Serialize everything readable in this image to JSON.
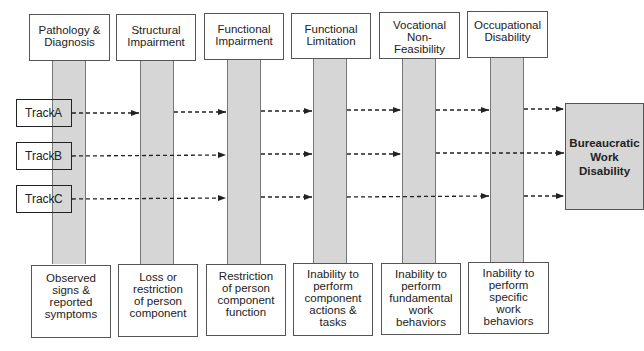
{
  "stages": [
    {
      "title": "Pathology & Diagnosis",
      "title_lines": [
        "Pathology &",
        "Diagnosis"
      ],
      "description_lines": [
        "Observed",
        "signs &",
        "reported",
        "symptoms"
      ]
    },
    {
      "title": "Structural Impairment",
      "title_lines": [
        "Structural",
        "Impairment"
      ],
      "description_lines": [
        "Loss or",
        "restriction",
        "of person",
        "component"
      ]
    },
    {
      "title": "Functional Impairment",
      "title_lines": [
        "Functional",
        "Impairment"
      ],
      "description_lines": [
        "Restriction",
        "of person",
        "component",
        "function"
      ]
    },
    {
      "title": "Functional Limitation",
      "title_lines": [
        "Functional",
        "Limitation"
      ],
      "description_lines": [
        "Inability to",
        "perform",
        "component",
        "actions &",
        "tasks"
      ]
    },
    {
      "title": "Vocational Non-Feasibility",
      "title_lines": [
        "Vocational",
        "Non-",
        "Feasibility"
      ],
      "description_lines": [
        "Inability to",
        "perform",
        "fundamental",
        "work",
        "behaviors"
      ]
    },
    {
      "title": "Occupational Disability",
      "title_lines": [
        "Occupational",
        "Disability"
      ],
      "description_lines": [
        "Inability to",
        "perform",
        "specific",
        "work",
        "behaviors"
      ]
    }
  ],
  "tracks": [
    {
      "label": "Track",
      "letter": "A",
      "stops": [
        "Structural Impairment",
        "Functional Impairment",
        "Functional Limitation",
        "Vocational Non-Feasibility",
        "Occupational Disability",
        "Bureaucratic Work Disability"
      ]
    },
    {
      "label": "Track",
      "letter": "B",
      "stops": [
        "Functional Impairment",
        "Functional Limitation",
        "Vocational Non-Feasibility",
        "Bureaucratic Work Disability"
      ]
    },
    {
      "label": "Track",
      "letter": "C",
      "stops": [
        "Functional Impairment",
        "Functional Limitation",
        "Occupational Disability",
        "Bureaucratic Work Disability"
      ]
    }
  ],
  "outcome": {
    "title": "Bureaucratic Work Disability",
    "title_lines": [
      "Bureaucratic",
      "Work",
      "Disability"
    ]
  },
  "colors": {
    "pillar": "#d6d6d6",
    "border": "#555555",
    "arrow": "#222222",
    "outcome_fill": "#d6d6d6"
  }
}
